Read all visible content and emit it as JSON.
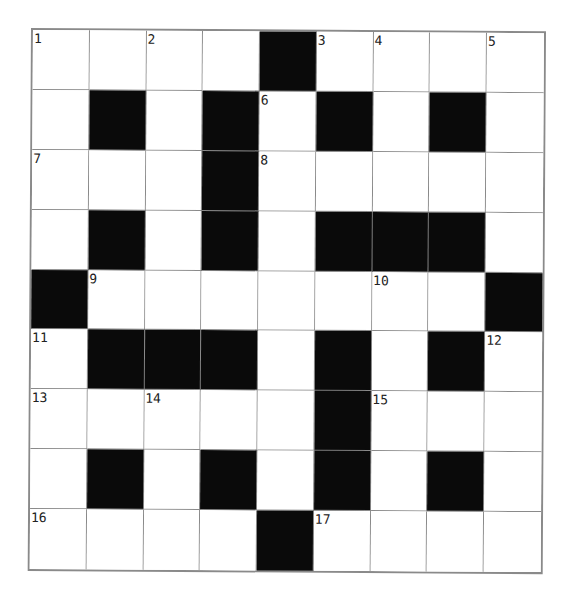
{
  "puzzle": {
    "rows": 9,
    "cols": 9,
    "colors": {
      "black": "#0a0a0a",
      "white": "#ffffff",
      "gridline": "#8a8a8a"
    },
    "grid": [
      [
        "1",
        "",
        "2",
        "",
        "#",
        "3",
        "4",
        "",
        "5"
      ],
      [
        "",
        "#",
        "",
        "#",
        "6",
        "#",
        "",
        "#",
        ""
      ],
      [
        "7",
        "",
        "",
        "#",
        "8",
        "",
        "",
        "",
        ""
      ],
      [
        "",
        "#",
        "",
        "#",
        "",
        "#",
        "#",
        "#",
        ""
      ],
      [
        "#",
        "9",
        "",
        "",
        "",
        "",
        "10",
        "",
        "#"
      ],
      [
        "11",
        "#",
        "#",
        "#",
        "",
        "#",
        "",
        "#",
        "12"
      ],
      [
        "13",
        "",
        "14",
        "",
        "",
        "#",
        "15",
        "",
        ""
      ],
      [
        "",
        "#",
        "",
        "#",
        "",
        "#",
        "",
        "#",
        ""
      ],
      [
        "16",
        "",
        "",
        "",
        "#",
        "17",
        "",
        "",
        ""
      ]
    ],
    "clue_numbers": [
      1,
      2,
      3,
      4,
      5,
      6,
      7,
      8,
      9,
      10,
      11,
      12,
      13,
      14,
      15,
      16,
      17
    ]
  }
}
